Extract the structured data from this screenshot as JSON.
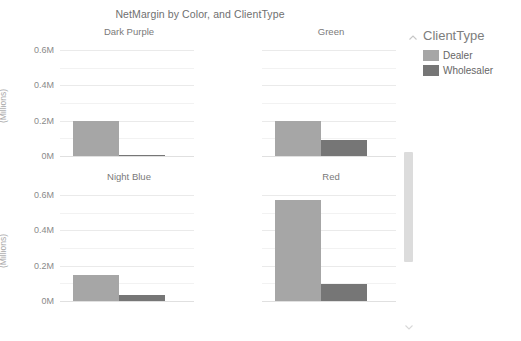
{
  "chart_data": {
    "type": "bar",
    "title": "NetMargin by Color, and ClientType",
    "xlabel": "",
    "ylabel": "(Millions)",
    "ylim": [
      0,
      0.6
    ],
    "y_ticks": [
      "0M",
      "0.2M",
      "0.4M",
      "0.6M"
    ],
    "y_tick_values": [
      0,
      0.2,
      0.4,
      0.6
    ],
    "gridlines": [
      0.1,
      0.2,
      0.3,
      0.4,
      0.5,
      0.6
    ],
    "grid": true,
    "legend_position": "right",
    "facet_by": "Color",
    "categories": [
      "Dealer",
      "Wholesaler"
    ],
    "series": [
      {
        "name": "Dealer",
        "color": "#a6a6a6"
      },
      {
        "name": "Wholesaler",
        "color": "#767676"
      }
    ],
    "facets": [
      {
        "name": "Dark Purple",
        "values": [
          0.2,
          0.003
        ]
      },
      {
        "name": "Green",
        "values": [
          0.2,
          0.088
        ]
      },
      {
        "name": "Night Blue",
        "values": [
          0.148,
          0.034
        ]
      },
      {
        "name": "Red",
        "values": [
          0.572,
          0.098
        ]
      }
    ]
  },
  "legend": {
    "title": "ClientType",
    "items": [
      {
        "label": "Dealer",
        "color": "#a6a6a6"
      },
      {
        "label": "Wholesaler",
        "color": "#767676"
      }
    ]
  },
  "axis": {
    "unit_label": "(Millions)"
  },
  "colors": {
    "dealer": "#a6a6a6",
    "wholesaler": "#767676",
    "gridline": "#f2f2f2",
    "text": "#7a7a7a",
    "scrollbar_thumb": "#dcdcdc"
  }
}
